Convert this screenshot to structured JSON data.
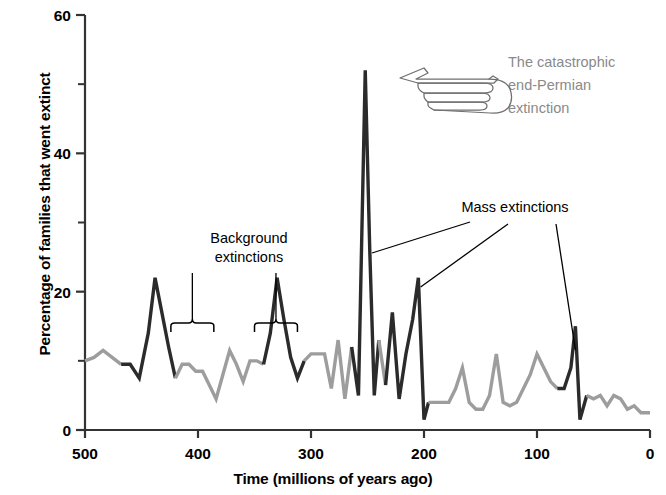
{
  "chart_data": {
    "type": "line",
    "title": "",
    "xlabel": "Time (millions of years ago)",
    "ylabel": "Percentage of families that went extinct",
    "xlim": [
      500,
      0
    ],
    "ylim": [
      0,
      60
    ],
    "x_reversed": true,
    "grid": false,
    "legend": "none",
    "x_ticks": [
      500,
      400,
      300,
      200,
      100,
      0
    ],
    "x_tick_labels": [
      "500",
      "400",
      "300",
      "200",
      "100",
      "0"
    ],
    "x_minor_ticks": [
      450,
      350,
      250,
      150,
      50
    ],
    "y_ticks": [
      0,
      20,
      40,
      60
    ],
    "y_tick_labels": [
      "0",
      "20",
      "40",
      "60"
    ],
    "y_minor_ticks": [
      10,
      30,
      50
    ],
    "series": [
      {
        "name": "Percentage of families that went extinct",
        "color_background": "#9d9d9d",
        "color_mass_extinction": "#2b2b2b",
        "x": [
          500,
          492,
          484,
          476,
          468,
          460,
          452,
          444,
          438,
          432,
          426,
          420,
          414,
          408,
          402,
          396,
          390,
          384,
          378,
          372,
          366,
          360,
          354,
          348,
          342,
          336,
          330,
          324,
          318,
          312,
          306,
          300,
          294,
          288,
          282,
          276,
          270,
          264,
          258,
          252,
          248,
          244,
          240,
          234,
          228,
          222,
          216,
          210,
          205,
          200,
          196,
          190,
          184,
          178,
          172,
          166,
          160,
          154,
          148,
          142,
          136,
          130,
          124,
          118,
          112,
          106,
          100,
          94,
          88,
          82,
          76,
          70,
          66,
          62,
          56,
          50,
          44,
          38,
          32,
          26,
          20,
          14,
          8,
          2,
          0
        ],
        "y": [
          10,
          10.5,
          11.5,
          10.5,
          9.5,
          9.5,
          7.5,
          14,
          22,
          17,
          12,
          7.5,
          9.5,
          9.5,
          8.5,
          8.5,
          6.5,
          4.5,
          8,
          11.5,
          9.5,
          7,
          10,
          10,
          9.5,
          14,
          22,
          16,
          10.5,
          7.5,
          10,
          11,
          11,
          11,
          6,
          13,
          4.5,
          12,
          5,
          52,
          26,
          5,
          13,
          6.5,
          17,
          4.5,
          11,
          16,
          22,
          1.5,
          4,
          4,
          4,
          4,
          6,
          9,
          4,
          3,
          3,
          5,
          11,
          4,
          3.5,
          4,
          6,
          8,
          11,
          9,
          7,
          6,
          6,
          9,
          15,
          1.5,
          5,
          4.5,
          5,
          3.5,
          5,
          4.5,
          3,
          3.5,
          2.5,
          2.5,
          2.5
        ],
        "mass_extinction_spans": [
          {
            "from": 460,
            "to": 426,
            "label": "Late Ordovician"
          },
          {
            "from": 336,
            "to": 312,
            "label": "Late Devonian"
          },
          {
            "from": 258,
            "to": 244,
            "label": "End-Permian"
          },
          {
            "from": 228,
            "to": 216,
            "label": "Late Triassic"
          },
          {
            "from": 210,
            "to": 200,
            "label": "End-Triassic"
          },
          {
            "from": 76,
            "to": 62,
            "label": "End-Cretaceous"
          }
        ]
      }
    ],
    "annotations": [
      {
        "id": "end-permian",
        "text": "The catastrophic\nend-Permian\nextinction",
        "lines": [
          "The catastrophic",
          "end-Permian",
          "extinction"
        ],
        "color": "#8a8a8a",
        "icon": "pointing-hand-left-icon",
        "points_to_x": 252,
        "points_to_y": 52
      },
      {
        "id": "mass-extinctions",
        "text": "Mass extinctions",
        "color": "#000000",
        "leader_targets": [
          252,
          205,
          66
        ]
      },
      {
        "id": "background-extinctions",
        "text": "Background\nextinctions",
        "lines": [
          "Background",
          "extinctions"
        ],
        "color": "#000000",
        "bracket_spans": [
          [
            424,
            386
          ],
          [
            350,
            312
          ]
        ]
      }
    ]
  },
  "axes": {
    "y_label": "Percentage of families that went extinct",
    "x_label": "Time (millions of years ago)",
    "y_tick_labels": [
      "60",
      "40",
      "20",
      "0"
    ],
    "x_tick_labels": [
      "500",
      "400",
      "300",
      "200",
      "100",
      "0"
    ]
  },
  "annotations": {
    "end_permian": {
      "line1": "The catastrophic",
      "line2": "end-Permian",
      "line3": "extinction"
    },
    "mass_extinctions": "Mass extinctions",
    "background": {
      "line1": "Background",
      "line2": "extinctions"
    }
  },
  "colors": {
    "background_curve": "#9d9d9d",
    "mass_extinction_curve": "#2b2b2b",
    "annotation_gray": "#8a8a8a",
    "axis": "#333333",
    "text": "#000000",
    "page_background": "#ffffff"
  }
}
